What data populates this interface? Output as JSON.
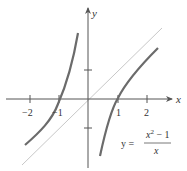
{
  "figure": {
    "axis_labels": {
      "x": "x",
      "y": "y"
    },
    "x_ticks": [
      "−2",
      "−1",
      "1",
      "2"
    ],
    "equation": {
      "lhs": "y =",
      "numerator": "x² − 1",
      "numerator_base": "x",
      "numerator_exp": "2",
      "numerator_rest": " − 1",
      "denominator": "x"
    },
    "colors": {
      "curve": "#6b6b6b",
      "asymptote": "#c8c8c8",
      "axis": "#555555"
    }
  }
}
